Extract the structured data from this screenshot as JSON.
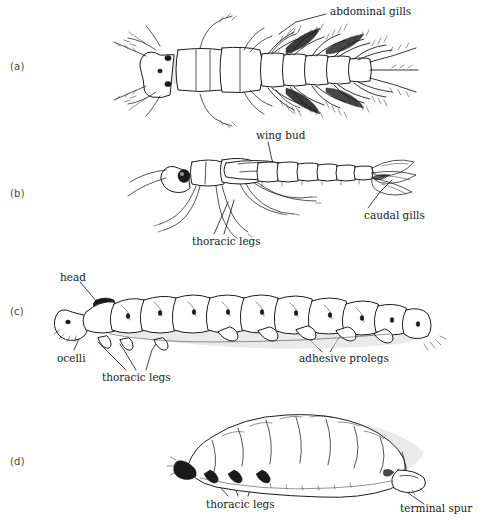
{
  "figure": {
    "background_color": "#fefefe",
    "ink_color": "#1a1a1a",
    "width": 483,
    "height": 528
  },
  "panels": [
    {
      "letter": "(a)",
      "subject": "mayfly-nymph-dorsal-view",
      "labels": [
        {
          "text": "abdominal gills",
          "x": 330,
          "y": 6
        }
      ]
    },
    {
      "letter": "(b)",
      "subject": "stonefly-nymph-lateral-view",
      "labels": [
        {
          "text": "wing bud",
          "x": 256,
          "y": 130
        },
        {
          "text": "caudal gills",
          "x": 364,
          "y": 210
        },
        {
          "text": "thoracic legs",
          "x": 192,
          "y": 236
        }
      ]
    },
    {
      "letter": "(c)",
      "subject": "caterpillar-larva-lateral-view",
      "labels": [
        {
          "text": "head",
          "x": 60,
          "y": 272
        },
        {
          "text": "ocelli",
          "x": 57,
          "y": 353
        },
        {
          "text": "thoracic legs",
          "x": 102,
          "y": 372
        },
        {
          "text": "adhesive prolegs",
          "x": 299,
          "y": 353
        }
      ]
    },
    {
      "letter": "(d)",
      "subject": "grub-larva-lateral-view",
      "labels": [
        {
          "text": "thoracic legs",
          "x": 206,
          "y": 499
        },
        {
          "text": "terminal spur",
          "x": 400,
          "y": 503
        }
      ]
    }
  ],
  "panel_letters": {
    "a": {
      "text": "(a)",
      "x": 10,
      "y": 61
    },
    "b": {
      "text": "(b)",
      "x": 10,
      "y": 188
    },
    "c": {
      "text": "(c)",
      "x": 10,
      "y": 306
    },
    "d": {
      "text": "(d)",
      "x": 10,
      "y": 456
    }
  }
}
